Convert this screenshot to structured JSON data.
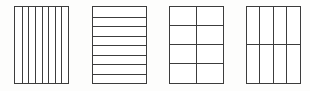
{
  "figure": {
    "background_color": "#fdfdfc",
    "line_color": "#3c3c3c",
    "fill_color": "#ffffff",
    "shape_count": 4,
    "shapes": [
      {
        "name": "rectangle-vertical-eighths",
        "partition_label": "",
        "columns": 8,
        "rows": 1,
        "total_parts": 8,
        "orientation": "vertical"
      },
      {
        "name": "rectangle-horizontal-eighths",
        "partition_label": "",
        "columns": 1,
        "rows": 8,
        "total_parts": 8,
        "orientation": "horizontal"
      },
      {
        "name": "rectangle-grid-2x4",
        "partition_label": "",
        "columns": 2,
        "rows": 4,
        "total_parts": 8,
        "orientation": "grid"
      },
      {
        "name": "rectangle-grid-4x2",
        "partition_label": "",
        "columns": 4,
        "rows": 2,
        "total_parts": 8,
        "orientation": "grid"
      }
    ]
  }
}
